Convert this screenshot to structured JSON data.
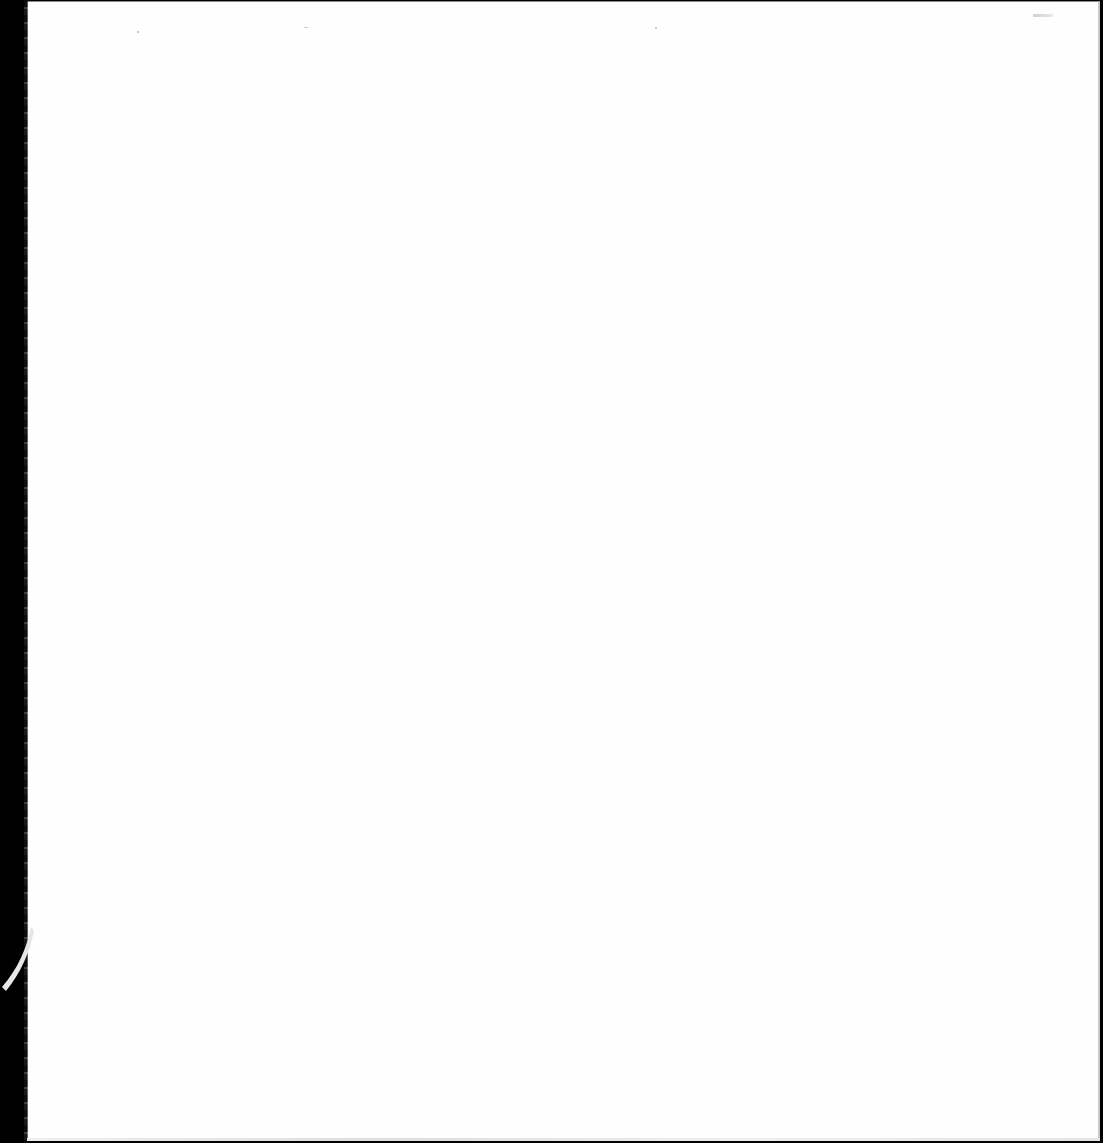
{
  "document": {
    "type": "scanned-blank-page",
    "text_content": "",
    "colors": {
      "paper": "#fefefe",
      "scanner_background": "#000000",
      "border": "#8a8a8a"
    }
  }
}
